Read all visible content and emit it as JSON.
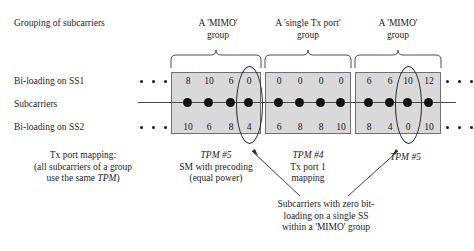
{
  "figure": {
    "heading": "Grouping of subcarriers"
  },
  "groups": [
    {
      "caption_line1": "A 'MIMO'",
      "caption_line2": "group",
      "ss1": [
        "8",
        "10",
        "6",
        "0"
      ],
      "ss2": [
        "10",
        "6",
        "8",
        "4"
      ],
      "tpm_label": "TPM #5",
      "tpm_desc_line1": "SM with precoding",
      "tpm_desc_line2": "(equal power)"
    },
    {
      "caption_line1": "A 'single Tx port'",
      "caption_line2": "group",
      "ss1": [
        "0",
        "0",
        "0",
        "0"
      ],
      "ss2": [
        "6",
        "8",
        "8",
        "10"
      ],
      "tpm_label": "TPM #4",
      "tpm_desc_line1": "Tx port 1",
      "tpm_desc_line2": "mapping"
    },
    {
      "caption_line1": "A 'MIMO'",
      "caption_line2": "group",
      "ss1": [
        "6",
        "6",
        "10",
        "12"
      ],
      "ss2": [
        "8",
        "4",
        "0",
        "10"
      ],
      "tpm_label": "TPM #5",
      "tpm_desc_line1": "",
      "tpm_desc_line2": ""
    }
  ],
  "row_labels": {
    "ss1": "Bi-loading on SS1",
    "subcarriers": "Subcarriers",
    "ss2": "Bi-loading on SS2"
  },
  "captions": {
    "tx_port_mapping_line1": "Tx port mapping:",
    "tx_port_mapping_line2": "(all subcarriers of a group",
    "tx_port_mapping_line3_pre": "use the same ",
    "tx_port_mapping_line3_ital": "TPM",
    "tx_port_mapping_line3_post": ")",
    "zero_note_line1": "Subcarriers with zero bit-",
    "zero_note_line2": "loading on a single SS",
    "zero_note_line3": "within a 'MIMO' group"
  },
  "colors": {
    "box_fill": "#d9d9d9",
    "box_border": "#6f6f6f",
    "ink": "#1a1a1a",
    "dot": "#111111"
  }
}
